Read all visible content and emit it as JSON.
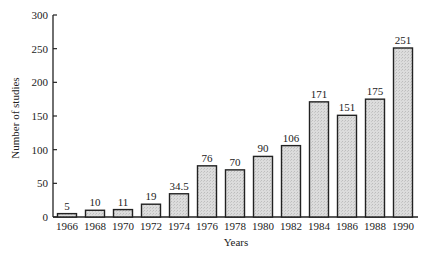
{
  "chart_data": {
    "type": "bar",
    "title": "",
    "xlabel": "Years",
    "ylabel": "Number of studies",
    "ylim": [
      0,
      300
    ],
    "yticks": [
      0,
      50,
      100,
      150,
      200,
      250,
      300
    ],
    "grid": false,
    "legend": null,
    "categories": [
      "1966",
      "1968",
      "1970",
      "1972",
      "1974",
      "1976",
      "1978",
      "1980",
      "1982",
      "1984",
      "1986",
      "1988",
      "1990"
    ],
    "values": [
      5,
      10,
      11,
      19,
      34.5,
      76,
      70,
      90,
      106,
      171,
      151,
      175,
      251
    ],
    "value_labels": [
      "5",
      "10",
      "11",
      "19",
      "34.5",
      "76",
      "70",
      "90",
      "106",
      "171",
      "151",
      "175",
      "251"
    ],
    "bar_fill": "#d9d9d9",
    "bar_stroke": "#222222"
  }
}
